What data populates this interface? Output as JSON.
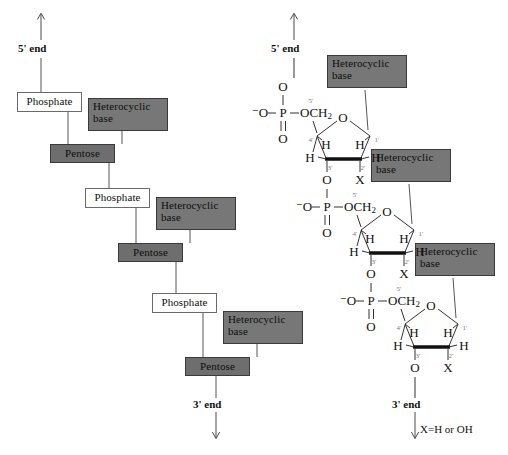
{
  "figure": {
    "footnote": "X=H or OH",
    "colors": {
      "phosphate_box": "#ffffff",
      "pentose_box": "#6e6e6e",
      "base_box": "#777777",
      "line": "#555555",
      "text": "#111111",
      "background": "#ffffff"
    }
  },
  "schematic": {
    "five_prime_label": "5' end",
    "three_prime_label": "3' end",
    "units": [
      {
        "phosphate": "Phosphate",
        "pentose": "Pentose",
        "base": "Heterocyclic\nbase"
      },
      {
        "phosphate": "Phosphate",
        "pentose": "Pentose",
        "base": "Heterocyclic\nbase"
      },
      {
        "phosphate": "Phosphate",
        "pentose": "Pentose",
        "base": "Heterocyclic\nbase"
      }
    ]
  },
  "structure": {
    "five_prime_label": "5' end",
    "three_prime_label": "3' end",
    "base_label": "Heterocyclic\nbase",
    "atoms": {
      "oxygen": "O",
      "phosphorus": "P",
      "minus_oxygen": "⁻O",
      "och2": "OCH",
      "och2_sub": "2",
      "hydrogen": "H",
      "x_group": "X"
    },
    "carbon_numbers": {
      "c1": "1'",
      "c2": "2'",
      "c3": "3'",
      "c4": "4'",
      "c5": "5'"
    },
    "nucleotides": [
      {
        "index": 1,
        "base": "Heterocyclic\nbase",
        "x_substituent": "X"
      },
      {
        "index": 2,
        "base": "Heterocyclic\nbase",
        "x_substituent": "X"
      },
      {
        "index": 3,
        "base": "Heterocyclic\nbase",
        "x_substituent": "X"
      }
    ]
  }
}
